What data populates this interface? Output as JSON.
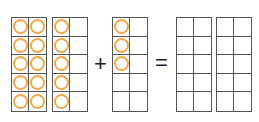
{
  "equation": {
    "operator_plus": "+",
    "operator_equals": "=",
    "counter_color": "#f0a848",
    "addend1": {
      "frames": [
        {
          "filled": [
            1,
            1,
            1,
            1,
            1,
            1,
            1,
            1,
            1,
            1
          ]
        },
        {
          "filled": [
            1,
            0,
            1,
            0,
            1,
            0,
            1,
            0,
            1,
            0
          ]
        }
      ],
      "total": 15
    },
    "addend2": {
      "frames": [
        {
          "filled": [
            1,
            0,
            1,
            0,
            1,
            0,
            0,
            0,
            0,
            0
          ]
        }
      ],
      "total": 3
    },
    "result": {
      "frames": [
        {
          "filled": [
            0,
            0,
            0,
            0,
            0,
            0,
            0,
            0,
            0,
            0
          ]
        },
        {
          "filled": [
            0,
            0,
            0,
            0,
            0,
            0,
            0,
            0,
            0,
            0
          ]
        }
      ]
    }
  }
}
